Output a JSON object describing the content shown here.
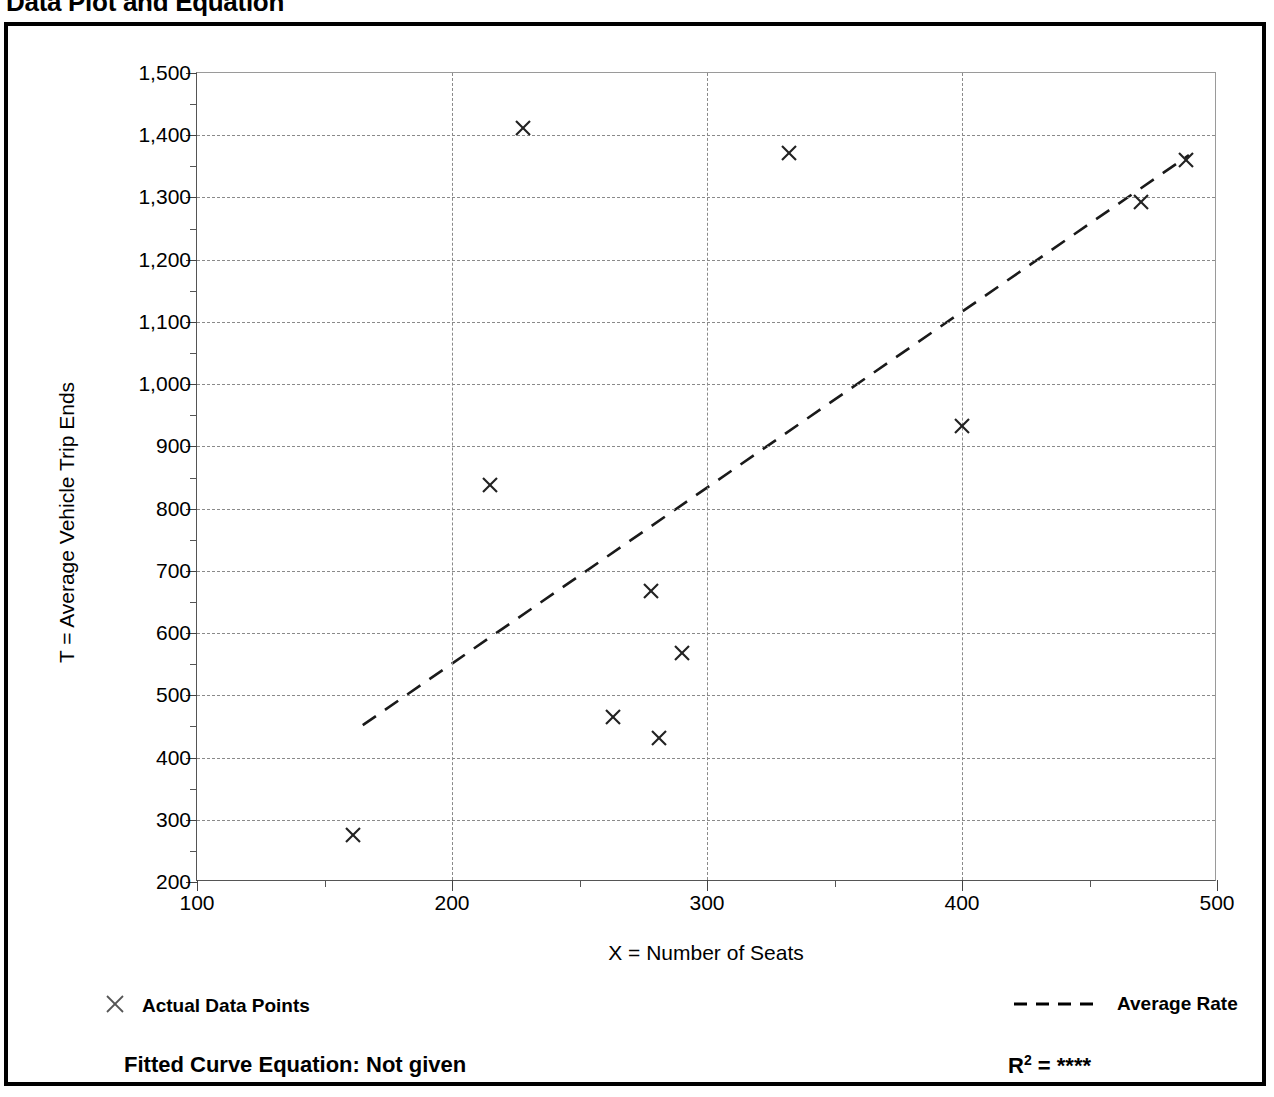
{
  "page_title": "Data Plot and Equation",
  "chart_data": {
    "type": "scatter",
    "title": "Data Plot and Equation",
    "xlabel": "X = Number of Seats",
    "ylabel": "T = Average Vehicle Trip Ends",
    "xlim": [
      100,
      500
    ],
    "ylim": [
      200,
      1500
    ],
    "xticks": [
      100,
      200,
      300,
      400,
      500
    ],
    "yticks": [
      200,
      300,
      400,
      500,
      600,
      700,
      800,
      900,
      1000,
      1100,
      1200,
      1300,
      1400,
      1500
    ],
    "ytick_labels": [
      "200",
      "300",
      "400",
      "500",
      "600",
      "700",
      "800",
      "900",
      "1,000",
      "1,100",
      "1,200",
      "1,300",
      "1,400",
      "1,500"
    ],
    "xtick_labels": [
      "100",
      "200",
      "300",
      "400",
      "500"
    ],
    "x_minor_step": 50,
    "y_minor_step": 50,
    "grid": true,
    "grid_style": "dotted",
    "legend_position": "below-axes",
    "series": [
      {
        "name": "Actual Data Points",
        "type": "scatter",
        "marker": "x",
        "points": [
          {
            "x": 161,
            "y": 275
          },
          {
            "x": 215,
            "y": 838
          },
          {
            "x": 228,
            "y": 1412
          },
          {
            "x": 263,
            "y": 465
          },
          {
            "x": 278,
            "y": 668
          },
          {
            "x": 281,
            "y": 432
          },
          {
            "x": 290,
            "y": 568
          },
          {
            "x": 332,
            "y": 1372
          },
          {
            "x": 400,
            "y": 932
          },
          {
            "x": 470,
            "y": 1292
          },
          {
            "x": 488,
            "y": 1360
          }
        ]
      },
      {
        "name": "Average Rate",
        "type": "line",
        "style": "dashed",
        "endpoints": [
          {
            "x": 165,
            "y": 452
          },
          {
            "x": 489,
            "y": 1368
          }
        ]
      }
    ],
    "annotations": {
      "fitted_curve_equation": "Fitted Curve Equation:  Not given",
      "r_squared_label": "R",
      "r_squared_exponent": "2",
      "r_squared_value": "= ****"
    }
  },
  "legend": {
    "left_label": "Actual Data Points",
    "right_label": "Average Rate"
  },
  "footer": {
    "equation": "Fitted Curve Equation:  Not given",
    "r2_base": "R",
    "r2_sup": "2",
    "r2_rest": " = ****"
  }
}
